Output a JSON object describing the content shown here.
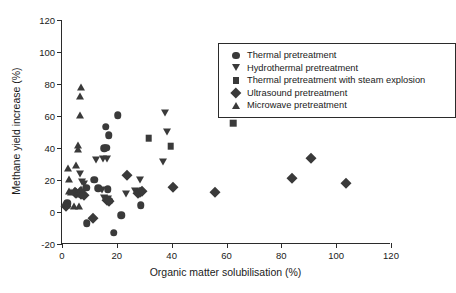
{
  "chart_data": {
    "type": "scatter",
    "title": "",
    "xlabel": "Organic matter solubilisation (%)",
    "ylabel": "Methane yield increase (%)",
    "xlim": [
      0,
      120
    ],
    "ylim": [
      -20,
      120
    ],
    "xticks": [
      0,
      20,
      40,
      60,
      80,
      100,
      120
    ],
    "yticks": [
      -20,
      0,
      20,
      40,
      60,
      80,
      100,
      120
    ],
    "grid": false,
    "legend_position": "top-right-inside",
    "marker_color": "#3a3a3a",
    "series": [
      {
        "name": "Thermal pretreatment",
        "marker": "circle",
        "points": [
          [
            1.6,
            4.5
          ],
          [
            2.0,
            5.5
          ],
          [
            8.8,
            15.2
          ],
          [
            9.0,
            -7.0
          ],
          [
            11.8,
            20.3
          ],
          [
            13.2,
            15.0
          ],
          [
            15.4,
            39.8
          ],
          [
            16.2,
            40.2
          ],
          [
            16.0,
            53.2
          ],
          [
            17.0,
            47.9
          ],
          [
            16.6,
            14.2
          ],
          [
            17.4,
            7.0
          ],
          [
            18.8,
            -13.0
          ],
          [
            20.4,
            60.6
          ],
          [
            21.6,
            -2.0
          ],
          [
            28.8,
            4.3
          ]
        ]
      },
      {
        "name": "Hydrothermal pretreatment",
        "marker": "triangle-down",
        "points": [
          [
            6.4,
            24.0
          ],
          [
            7.2,
            18.6
          ],
          [
            8.0,
            17.8
          ],
          [
            12.4,
            32.8
          ],
          [
            15.0,
            33.0
          ],
          [
            16.4,
            32.9
          ],
          [
            14.6,
            13.8
          ],
          [
            15.2,
            8.6
          ],
          [
            16.8,
            8.4
          ],
          [
            23.4,
            11.0
          ],
          [
            26.6,
            13.4
          ],
          [
            28.6,
            20.2
          ],
          [
            37.0,
            31.2
          ],
          [
            37.4,
            62.0
          ],
          [
            38.4,
            50.3
          ]
        ]
      },
      {
        "name": "Thermal pretreatment with steam explosion",
        "marker": "square",
        "points": [
          [
            31.6,
            46.2
          ],
          [
            39.6,
            41.0
          ],
          [
            62.4,
            55.6
          ]
        ]
      },
      {
        "name": "Ultrasound pretreatment",
        "marker": "diamond",
        "points": [
          [
            1.4,
            4.0
          ],
          [
            4.6,
            12.6
          ],
          [
            5.2,
            11.8
          ],
          [
            6.4,
            12.2
          ],
          [
            7.0,
            11.4
          ],
          [
            8.2,
            10.4
          ],
          [
            11.4,
            -4.0
          ],
          [
            16.4,
            7.4
          ],
          [
            17.2,
            6.6
          ],
          [
            23.8,
            23.4
          ],
          [
            27.6,
            11.6
          ],
          [
            28.4,
            12.4
          ],
          [
            29.0,
            13.4
          ],
          [
            40.6,
            15.6
          ],
          [
            55.8,
            12.8
          ],
          [
            83.8,
            21.0
          ],
          [
            90.8,
            33.8
          ],
          [
            103.6,
            18.2
          ]
        ]
      },
      {
        "name": "Microwave pretreatment",
        "marker": "triangle-up",
        "points": [
          [
            2.2,
            27.6
          ],
          [
            2.4,
            20.6
          ],
          [
            2.6,
            13.0
          ],
          [
            3.4,
            12.8
          ],
          [
            1.8,
            4.6
          ],
          [
            5.2,
            29.4
          ],
          [
            5.8,
            42.0
          ],
          [
            6.0,
            39.4
          ],
          [
            6.4,
            60.4
          ],
          [
            6.6,
            72.3
          ],
          [
            7.0,
            78.4
          ],
          [
            6.8,
            14.6
          ],
          [
            7.0,
            11.4
          ],
          [
            4.4,
            3.6
          ],
          [
            6.2,
            4.0
          ]
        ]
      }
    ]
  },
  "legend": {
    "entries": [
      {
        "label": "Thermal pretreatment",
        "marker": "circle"
      },
      {
        "label": "Hydrothermal pretreatment",
        "marker": "triangle-down"
      },
      {
        "label": "Thermal pretreatment with steam explosion",
        "marker": "square"
      },
      {
        "label": "Ultrasound pretreatment",
        "marker": "diamond"
      },
      {
        "label": "Microwave pretreatment",
        "marker": "triangle-up"
      }
    ]
  }
}
